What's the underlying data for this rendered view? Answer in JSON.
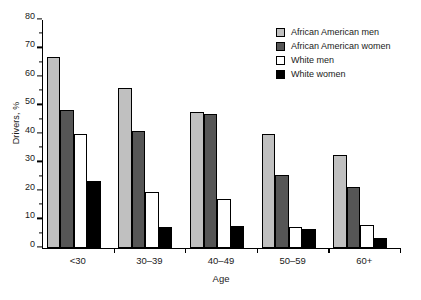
{
  "chart_data": {
    "type": "bar",
    "title": "",
    "xlabel": "Age",
    "ylabel": "Drivers, %",
    "categories": [
      "<30",
      "30–39",
      "40–49",
      "50–59",
      "60+"
    ],
    "series": [
      {
        "name": "African American men",
        "color": "#c0c0c0",
        "values": [
          67,
          56,
          47.8,
          40,
          32.5
        ]
      },
      {
        "name": "African American women",
        "color": "#565656",
        "values": [
          48.5,
          41,
          47,
          25.5,
          21.5
        ]
      },
      {
        "name": "White men",
        "color": "#ffffff",
        "values": [
          40,
          19.8,
          17.2,
          7.5,
          8
        ]
      },
      {
        "name": "White women",
        "color": "#000000",
        "values": [
          23.5,
          7.5,
          7.7,
          6.5,
          3.5
        ]
      }
    ],
    "ylim": [
      0,
      80
    ],
    "ytick_major": [
      0,
      10,
      20,
      30,
      40,
      50,
      60,
      70,
      80
    ],
    "ytick_minor": [
      5,
      15,
      25,
      35,
      45,
      55,
      65,
      75
    ],
    "grid": false,
    "legend_position": "top-right",
    "bar_outline_color": "#000000"
  }
}
